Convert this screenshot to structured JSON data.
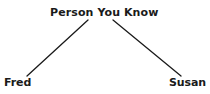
{
  "diagram": {
    "type": "tree",
    "background_color": "#ffffff",
    "line_color": "#1a1a1a",
    "text_color": "#1a1a1a",
    "nodes": [
      {
        "id": "root",
        "label": "Person You Know",
        "role": "parent"
      },
      {
        "id": "left",
        "label": "Fred",
        "role": "child"
      },
      {
        "id": "right",
        "label": "Susan",
        "role": "child"
      }
    ],
    "edges": [
      {
        "from": "root",
        "to": "left",
        "x1": 88,
        "y1": 20,
        "x2": 27,
        "y2": 76
      },
      {
        "from": "root",
        "to": "right",
        "x1": 113,
        "y1": 20,
        "x2": 181,
        "y2": 76
      }
    ]
  }
}
